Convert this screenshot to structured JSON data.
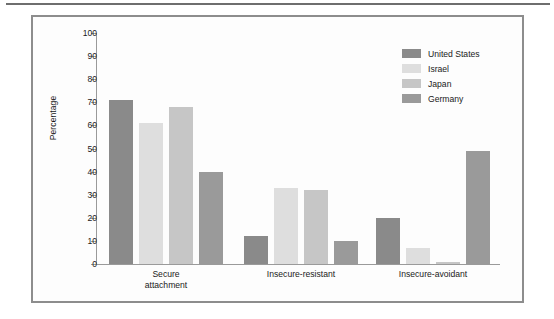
{
  "figure": {
    "border_color": "#8d8d8d",
    "background": "#fdfdfd",
    "rule_color": "#6e6e6e"
  },
  "chart_data": {
    "type": "bar",
    "title": "",
    "subtitle": "",
    "xlabel": "",
    "ylabel": "Percentage",
    "ylim": [
      0,
      100
    ],
    "ytick_labels": [
      "0",
      "10",
      "20",
      "30",
      "40",
      "50",
      "60",
      "70",
      "80",
      "90",
      "100"
    ],
    "yticks": [
      0,
      10,
      20,
      30,
      40,
      50,
      60,
      70,
      80,
      90,
      100
    ],
    "grid": false,
    "legend_position": "top-right",
    "categories": [
      "Secure attachment",
      "Insecure-resistant",
      "Insecure-avoidant"
    ],
    "category_lines": [
      [
        "Secure",
        "attachment"
      ],
      [
        "Insecure-resistant"
      ],
      [
        "Insecure-avoidant"
      ]
    ],
    "series": [
      {
        "name": "United States",
        "color": "#8a8a8a",
        "values": [
          71,
          12,
          20
        ]
      },
      {
        "name": "Israel",
        "color": "#dedede",
        "values": [
          61,
          33,
          7
        ]
      },
      {
        "name": "Japan",
        "color": "#c6c6c6",
        "values": [
          68,
          32,
          1
        ]
      },
      {
        "name": "Germany",
        "color": "#9a9a9a",
        "values": [
          40,
          10,
          49
        ]
      }
    ]
  }
}
